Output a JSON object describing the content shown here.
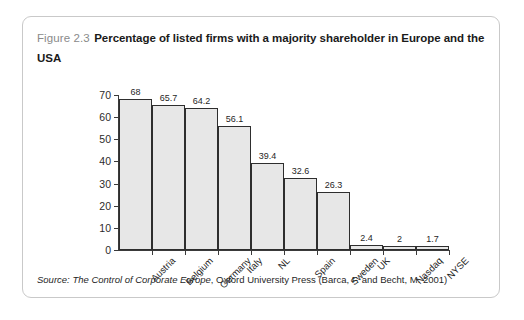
{
  "figure": {
    "number": "Figure 2.3",
    "title": "Percentage of listed firms with a majority shareholder in Europe and the USA",
    "source_prefix": "Source:",
    "source_italic": "The Control of Corporate Europe",
    "source_rest": ", Oxford University Press (Barca, F. and Becht, M. 2001)"
  },
  "chart_data": {
    "type": "bar",
    "title": "Percentage of listed firms with a majority shareholder in Europe and the USA",
    "xlabel": "",
    "ylabel": "",
    "ylim": [
      0,
      70
    ],
    "yticks": [
      0,
      10,
      20,
      30,
      40,
      50,
      60,
      70
    ],
    "grid": false,
    "legend": null,
    "categories": [
      "Austria",
      "Belgium",
      "Germany",
      "Italy",
      "NL",
      "Spain",
      "Sweden",
      "UK",
      "Nasdaq",
      "NYSE"
    ],
    "values": [
      68,
      65.7,
      64.2,
      56.1,
      39.4,
      32.6,
      26.3,
      2.4,
      2,
      1.7
    ],
    "value_labels": [
      "68",
      "65.7",
      "64.2",
      "56.1",
      "39.4",
      "32.6",
      "26.3",
      "2.4",
      "2",
      "1.7"
    ],
    "bar_fill": "#e7e7e7",
    "bar_edge": "#2e2e2e"
  }
}
